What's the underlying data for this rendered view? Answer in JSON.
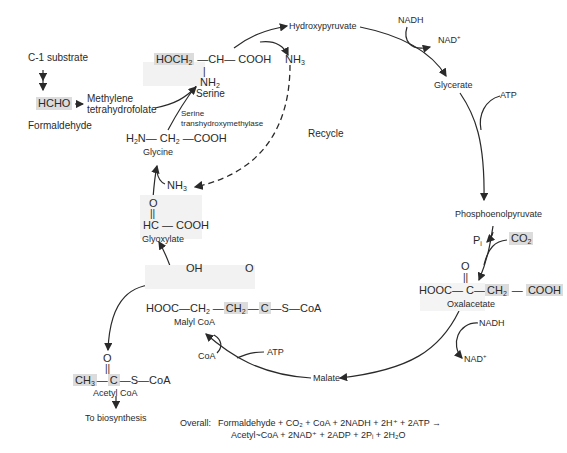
{
  "diagram": {
    "nodes": {
      "c1_substrate": "C-1 substrate",
      "hcho": "HCHO",
      "formaldehyde": "Formaldehyde",
      "methylene_thf_1": "Methylene",
      "methylene_thf_2": "tetrahydrofolate",
      "serine_formula_a": "HOCH",
      "serine_formula_a_sub": "2",
      "serine_formula_b": "—CH— COOH",
      "serine_nh2": "NH",
      "serine_nh2_sub": "2",
      "serine": "Serine",
      "enzyme_1": "Serine",
      "enzyme_2": "transhydroxymethylase",
      "glycine_formula_a": "H",
      "glycine_formula_a_sub": "2",
      "glycine_formula_b": "N— CH",
      "glycine_formula_b_sub": "2",
      "glycine_formula_c": " —COOH",
      "glycine": "Glycine",
      "nh3_top": "NH",
      "nh3_top_sub": "3",
      "nh3_mid": "NH",
      "nh3_mid_sub": "3",
      "recycle": "Recycle",
      "glyoxylate_o": "O",
      "glyoxylate_formula": "HC — COOH",
      "glyoxylate": "Glyoxylate",
      "hydroxypyruvate": "Hydroxypyruvate",
      "nadh_top": "NADH",
      "nad_top": "NAD",
      "nad_top_sup": "+",
      "glycerate": "Glycerate",
      "atp_right": "ATP",
      "pep": "Phosphoenolpyruvate",
      "pi": "P",
      "pi_sub": "i",
      "co2": "CO",
      "co2_sub": "2",
      "oxaloacetate_o": "O",
      "oxaloacetate_a": "HOOC— C—",
      "oxaloacetate_b": "CH",
      "oxaloacetate_b_sub": "2",
      "oxaloacetate_c": "COOH",
      "oxaloacetate": "Oxalacetate",
      "nadh_bottom": "NADH",
      "nad_bottom": "NAD",
      "nad_bottom_sup": "+",
      "malate": "Malate",
      "atp_bottom": "ATP",
      "coa": "CoA",
      "malyl_oh": "OH",
      "malyl_o": "O",
      "malyl_a": "HOOC—CH",
      "malyl_a_sub": "2",
      "malyl_b": "CH",
      "malyl_b_sub": "2",
      "malyl_c": "C",
      "malyl_d": "—S—CoA",
      "malyl_coa": "Malyl CoA",
      "acetyl_ch3": "CH",
      "acetyl_ch3_sub": "3",
      "acetyl_o": "O",
      "acetyl_c": "C",
      "acetyl_rest": "—S—CoA",
      "acetyl_coa": "Acetyl CoA",
      "to_biosynthesis": "To biosynthesis"
    },
    "overall": {
      "label": "Overall:",
      "line1": "Formaldehyde + CO₂ + CoA + 2NADH + 2H⁺ + 2ATP →",
      "line2": "Acetyl~CoA + 2NAD⁺ + 2ADP + 2Pᵢ + 2H₂O"
    }
  }
}
